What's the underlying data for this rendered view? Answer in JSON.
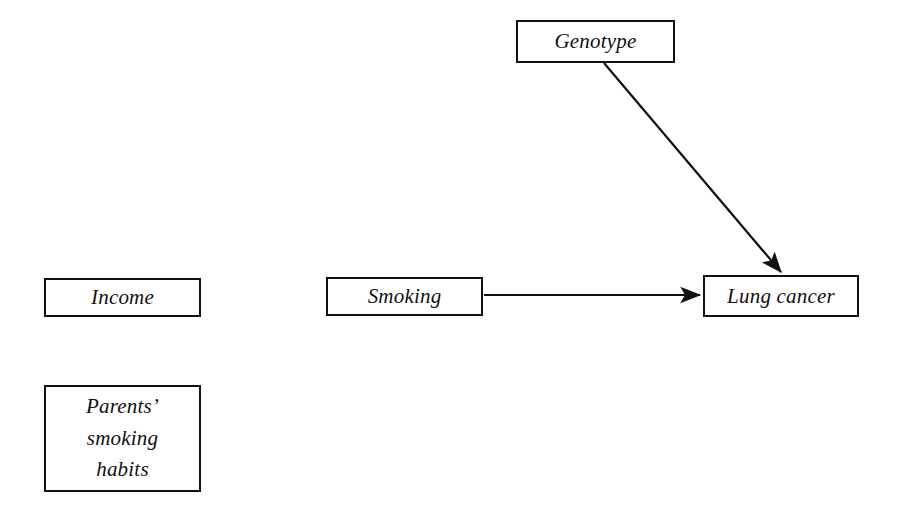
{
  "diagram": {
    "background_color": "#ffffff",
    "stroke_color": "#111111",
    "text_color": "#111111",
    "nodes": [
      {
        "id": "genotype",
        "label": "Genotype",
        "x": 516,
        "y": 20,
        "width": 159,
        "height": 43
      },
      {
        "id": "income",
        "label": "Income",
        "x": 44,
        "y": 278,
        "width": 157,
        "height": 39
      },
      {
        "id": "smoking",
        "label": "Smoking",
        "x": 326,
        "y": 277,
        "width": 157,
        "height": 39
      },
      {
        "id": "lung_cancer",
        "label": "Lung cancer",
        "x": 703,
        "y": 275,
        "width": 156,
        "height": 42
      },
      {
        "id": "parents_smoking_habits",
        "label": "Parents’\nsmoking\nhabits",
        "x": 44,
        "y": 385,
        "width": 157,
        "height": 107
      }
    ],
    "edges": [
      {
        "id": "genotype-to-lung-cancer",
        "from": "genotype",
        "to": "lung_cancer",
        "kind": "directed",
        "x1": 604,
        "y1": 63,
        "x2": 783,
        "y2": 274
      },
      {
        "id": "smoking-to-lung-cancer",
        "from": "smoking",
        "to": "lung_cancer",
        "kind": "directed",
        "x1": 484,
        "y1": 295,
        "x2": 702,
        "y2": 295
      }
    ]
  }
}
